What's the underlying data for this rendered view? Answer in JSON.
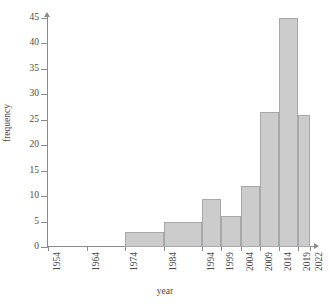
{
  "chart_data": {
    "type": "bar",
    "title": "",
    "xlabel": "year",
    "ylabel": "frequency",
    "grid": false,
    "legend": null,
    "xlim": [
      1954,
      2022
    ],
    "ylim": [
      0,
      45
    ],
    "ytick_labels": [
      "0",
      "5",
      "10",
      "15",
      "20",
      "25",
      "30",
      "35",
      "40",
      "45"
    ],
    "ytick_values": [
      0,
      5,
      10,
      15,
      20,
      25,
      30,
      35,
      40,
      45
    ],
    "xtick_labels": [
      "1954",
      "1964",
      "1974",
      "1984",
      "1994",
      "1999",
      "2004",
      "2009",
      "2014",
      "2019",
      "2022"
    ],
    "xtick_values": [
      1954,
      1964,
      1974,
      1984,
      1994,
      1999,
      2004,
      2009,
      2014,
      2019,
      2022
    ],
    "bin_edges": [
      1954,
      1964,
      1974,
      1984,
      1994,
      1999,
      2004,
      2009,
      2014,
      2019,
      2022
    ],
    "categories": [
      "1954-1964",
      "1964-1974",
      "1974-1984",
      "1984-1994",
      "1994-1999",
      "1999-2004",
      "2004-2009",
      "2009-2014",
      "2014-2019",
      "2019-2022"
    ],
    "values": [
      0,
      0,
      3,
      5,
      9.5,
      6,
      12,
      26.5,
      45,
      26
    ],
    "bar_fill_color": "#cccccc",
    "bar_edge_color": "#a8a8a8",
    "axis_color": "#8c8c8c",
    "text_color": "#4a4a4a"
  }
}
